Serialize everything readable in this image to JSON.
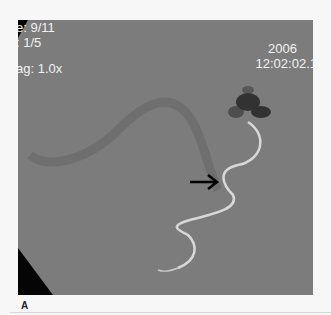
{
  "figure": {
    "panel_label": "A",
    "overlay": {
      "top_left": [
        "e: 9/11",
        ": 1/5",
        "ag: 1.0x"
      ],
      "top_right": [
        "2006",
        "12:02:02.1"
      ]
    },
    "annotation": "arrow pointing to tortuous vessel",
    "colors": {
      "background": "#7c7c7c",
      "text": "#f2f2f2",
      "page": "#f7f7f7"
    }
  }
}
